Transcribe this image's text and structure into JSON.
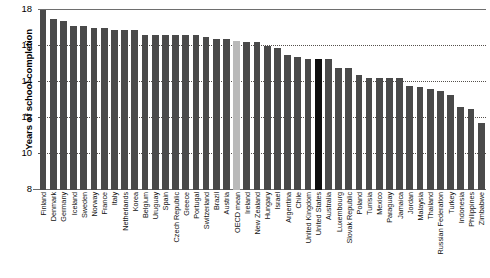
{
  "chart_data": {
    "type": "bar",
    "title": "",
    "xlabel": "",
    "ylabel": "Years of school completion",
    "ylim": [
      8,
      18
    ],
    "yticks": [
      8,
      10,
      12,
      14,
      16,
      18
    ],
    "grid": true,
    "gridlines_at": [
      10,
      12,
      14,
      16
    ],
    "legend": "none",
    "colors": {
      "bar": "#4a4a4a",
      "oecd_mean": "#b9b9b9",
      "united_states": "#0d0d0d",
      "gridline": "#55504c",
      "axis": "#6e6e6e"
    },
    "categories": [
      "Finland",
      "Denmark",
      "Germany",
      "Iceland",
      "Sweden",
      "Norway",
      "France",
      "Italy",
      "Netherlands",
      "Korea",
      "Belgium",
      "Uruguay",
      "Spain",
      "Czech Republic",
      "Greece",
      "Portugal",
      "Switzerland",
      "Brazil",
      "Austria",
      "OECD mean",
      "Ireland",
      "New Zealand",
      "Hungary",
      "Israel",
      "Argentina",
      "Chile",
      "United Kingdom",
      "United States",
      "Australia",
      "Luxembourg",
      "Slovak Republic",
      "Poland",
      "Tunisia",
      "Mexico",
      "Paraguay",
      "Jamaica",
      "Jordan",
      "Malaysia",
      "Thailand",
      "Russian Federation",
      "Turkey",
      "Indonesia",
      "Philippines",
      "Zimbabwe"
    ],
    "values": [
      18.0,
      17.5,
      17.4,
      17.1,
      17.1,
      17.0,
      17.0,
      16.9,
      16.9,
      16.9,
      16.6,
      16.6,
      16.6,
      16.6,
      16.6,
      16.6,
      16.5,
      16.4,
      16.4,
      16.3,
      16.2,
      16.2,
      16.0,
      15.9,
      15.5,
      15.4,
      15.3,
      15.3,
      15.3,
      14.8,
      14.8,
      14.4,
      14.2,
      14.2,
      14.2,
      14.2,
      13.8,
      13.7,
      13.6,
      13.5,
      13.3,
      12.6,
      12.5,
      11.7
    ],
    "highlighted": {
      "OECD mean": "light-gray",
      "United States": "black"
    }
  }
}
